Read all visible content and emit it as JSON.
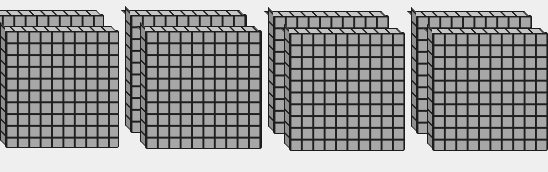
{
  "scene": {
    "description": "Base-ten blocks: groups of hundred flats",
    "background_color": "#efefef",
    "block_fill_color": "#a7a7a7",
    "grid_line_color": "#1e1e1e",
    "flat_grid": {
      "rows": 10,
      "cols": 10
    },
    "groups": [
      {
        "label": "group-1",
        "flats": 2,
        "x": 0,
        "y": 14
      },
      {
        "label": "group-2",
        "flats": 2,
        "x": 130,
        "y": 14
      },
      {
        "label": "group-3",
        "flats": 2,
        "x": 273,
        "y": 15
      },
      {
        "label": "group-4",
        "flats": 2,
        "x": 416,
        "y": 15,
        "partially_visible": true
      }
    ]
  }
}
